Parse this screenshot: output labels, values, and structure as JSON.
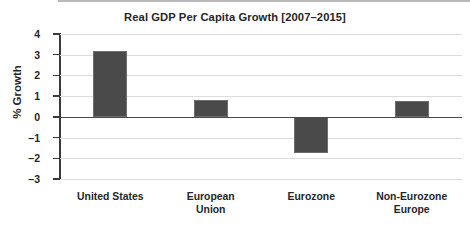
{
  "chart_data": {
    "type": "bar",
    "title": "Real GDP Per Capita Growth [2007–2015]",
    "xlabel": "",
    "ylabel": "% Growth",
    "categories": [
      "United States",
      "European Union",
      "Eurozone",
      "Non-Eurozone Europe"
    ],
    "category_lines": [
      [
        "United States"
      ],
      [
        "European",
        "Union"
      ],
      [
        "Eurozone"
      ],
      [
        "Non-Eurozone",
        "Europe"
      ]
    ],
    "values": [
      3.2,
      0.83,
      -1.75,
      0.78
    ],
    "ylim": [
      -3,
      4
    ],
    "yticks": [
      4,
      3,
      2,
      1,
      0,
      -1,
      -2,
      -3
    ],
    "ytick_labels": [
      "4",
      "3",
      "2",
      "1",
      "0",
      "–1",
      "–2",
      "–3"
    ],
    "grid": true,
    "legend": false,
    "bar_color": "#4a4a4a",
    "gridline_color": "#dddddd",
    "axis_color": "#3a3a3a",
    "background": "#ffffff"
  }
}
